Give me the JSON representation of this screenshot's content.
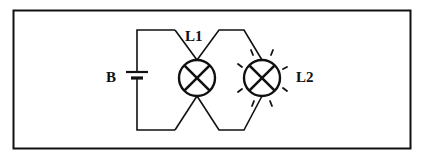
{
  "diagram": {
    "type": "circuit",
    "labels": {
      "battery": "B",
      "lamp1": "L1",
      "lamp2": "L2"
    },
    "components": [
      {
        "id": "B",
        "kind": "battery",
        "state": "source"
      },
      {
        "id": "L1",
        "kind": "lamp",
        "state": "off"
      },
      {
        "id": "L2",
        "kind": "lamp",
        "state": "lit"
      }
    ],
    "colors": {
      "line": "#111111",
      "background": "#ffffff"
    }
  }
}
